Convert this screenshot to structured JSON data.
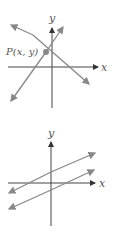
{
  "figure_top": {
    "x_axis_label": "x",
    "y_axis_label": "y",
    "point_label": "P(x, y)",
    "description": "Two intersecting lines meeting at point P(x, y)"
  },
  "figure_bottom": {
    "x_axis_label": "x",
    "y_axis_label": "y",
    "description": "Two parallel lines"
  },
  "colors": {
    "axis": "#333333",
    "line": "#888888",
    "point": "#888888"
  }
}
